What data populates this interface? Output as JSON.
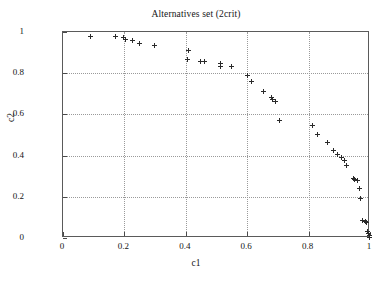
{
  "chart_data": {
    "type": "scatter",
    "title": "Alternatives set (2crit)",
    "xlabel": "c1",
    "ylabel": "c2",
    "xlim": [
      0,
      1
    ],
    "ylim": [
      0,
      1
    ],
    "xticks": [
      "0",
      "0.2",
      "0.4",
      "0.6",
      "0.8",
      "1"
    ],
    "xtick_values": [
      0,
      0.2,
      0.4,
      0.6,
      0.8,
      1
    ],
    "yticks": [
      "0",
      "0.2",
      "0.4",
      "0.6",
      "0.8",
      "1"
    ],
    "ytick_values": [
      0,
      0.2,
      0.4,
      0.6,
      0.8,
      1
    ],
    "grid": true,
    "legend": "none",
    "marker": "plus",
    "marker_color": "#2a2a2a",
    "series": [
      {
        "name": "alternatives",
        "points": [
          [
            0.09,
            0.98
          ],
          [
            0.17,
            0.98
          ],
          [
            0.198,
            0.972
          ],
          [
            0.203,
            0.963
          ],
          [
            0.228,
            0.958
          ],
          [
            0.248,
            0.945
          ],
          [
            0.298,
            0.935
          ],
          [
            0.408,
            0.908
          ],
          [
            0.405,
            0.868
          ],
          [
            0.448,
            0.858
          ],
          [
            0.462,
            0.855
          ],
          [
            0.512,
            0.845
          ],
          [
            0.513,
            0.833
          ],
          [
            0.548,
            0.832
          ],
          [
            0.6,
            0.788
          ],
          [
            0.615,
            0.758
          ],
          [
            0.652,
            0.712
          ],
          [
            0.678,
            0.683
          ],
          [
            0.683,
            0.673
          ],
          [
            0.692,
            0.665
          ],
          [
            0.705,
            0.57
          ],
          [
            0.812,
            0.548
          ],
          [
            0.828,
            0.503
          ],
          [
            0.862,
            0.465
          ],
          [
            0.882,
            0.423
          ],
          [
            0.893,
            0.405
          ],
          [
            0.908,
            0.393
          ],
          [
            0.918,
            0.375
          ],
          [
            0.925,
            0.352
          ],
          [
            0.945,
            0.287
          ],
          [
            0.948,
            0.282
          ],
          [
            0.958,
            0.277
          ],
          [
            0.965,
            0.238
          ],
          [
            0.968,
            0.19
          ],
          [
            0.975,
            0.085
          ],
          [
            0.985,
            0.082
          ],
          [
            0.988,
            0.075
          ],
          [
            0.992,
            0.032
          ],
          [
            0.994,
            0.022
          ],
          [
            0.997,
            0.012
          ],
          [
            0.999,
            0.004
          ]
        ]
      }
    ]
  }
}
